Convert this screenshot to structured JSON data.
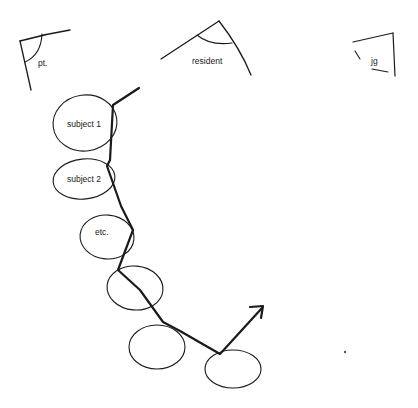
{
  "diagram": {
    "header_roles": [
      {
        "id": "patient",
        "label": "pt."
      },
      {
        "id": "resident",
        "label": "resident"
      },
      {
        "id": "jg",
        "label": "jg"
      }
    ],
    "nodes": [
      {
        "id": "subject-1",
        "label": "subject 1"
      },
      {
        "id": "subject-2",
        "label": "subject 2"
      },
      {
        "id": "etc",
        "label": "etc."
      },
      {
        "id": "node-4",
        "label": ""
      },
      {
        "id": "node-5",
        "label": ""
      },
      {
        "id": "node-6",
        "label": ""
      }
    ],
    "path": {
      "description": "zig-zag line connecting nodes, ending in an upward-right arrow"
    },
    "colors": {
      "ink": "#1a1a1a",
      "background": "#ffffff"
    }
  }
}
